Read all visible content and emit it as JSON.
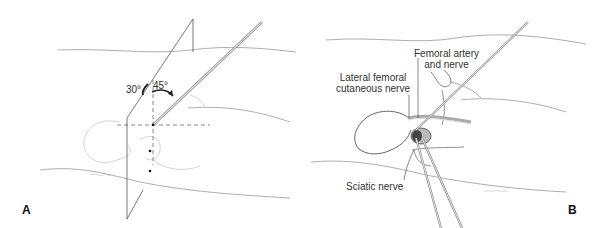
{
  "figure": {
    "panels": [
      {
        "id": "A",
        "letter": "A",
        "angles": {
          "left": "30°",
          "right": "45°"
        }
      },
      {
        "id": "B",
        "letter": "B",
        "labels": {
          "femoral_artery_line1": "Femoral artery",
          "femoral_artery_line2": "and nerve",
          "lateral_femoral_line1": "Lateral femoral",
          "lateral_femoral_line2": "cutaneous nerve",
          "sciatic": "Sciatic nerve"
        }
      }
    ],
    "colors": {
      "line": "#555555",
      "light_line": "#b0b0b0",
      "needle": "#888888",
      "text": "#333333"
    }
  }
}
